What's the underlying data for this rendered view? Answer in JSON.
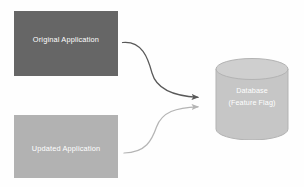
{
  "diagram": {
    "background_color": "#fefefe",
    "nodes": [
      {
        "id": "original-application",
        "label": "Original Application",
        "shape": "rectangle",
        "fill_color": "#666666",
        "text_color": "#ffffff"
      },
      {
        "id": "updated-application",
        "label": "Updated Application",
        "shape": "rectangle",
        "fill_color": "#b2b2b2",
        "text_color": "#ffffff"
      },
      {
        "id": "database",
        "label_line_1": "Database",
        "label_line_2": "(Feature Flag)",
        "shape": "cylinder",
        "fill_color": "#c6c6c6",
        "top_fill_color": "#cfcfcf",
        "stroke_color": "#b3b3b3",
        "text_color": "#ffffff"
      }
    ],
    "connectors": [
      {
        "id": "original-to-database",
        "from": "original-application",
        "to": "database",
        "style": "curved-arrow",
        "color": "#595959"
      },
      {
        "id": "updated-to-database",
        "from": "updated-application",
        "to": "database",
        "style": "curved-arrow",
        "color": "#b5b5b5"
      }
    ]
  }
}
